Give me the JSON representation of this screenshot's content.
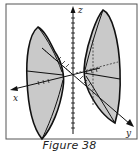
{
  "figure": {
    "caption": "Figure 38",
    "colors": {
      "frame": "#555555",
      "fill": "#c9c9c9",
      "stroke": "#111111",
      "background": "#ffffff"
    },
    "axes": {
      "x_label": "x",
      "y_label": "y",
      "z_label": "z"
    },
    "shapes": [
      {
        "name": "left-nappe",
        "description": "cone nappe opening toward -y"
      },
      {
        "name": "right-nappe",
        "description": "cone nappe opening toward +y"
      }
    ]
  }
}
